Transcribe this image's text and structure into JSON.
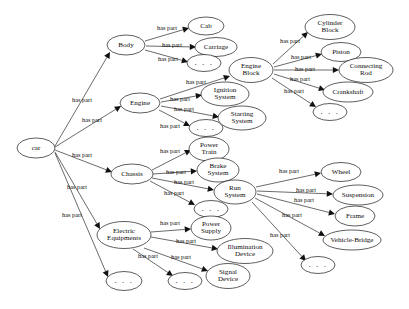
{
  "diagram": {
    "type": "directed-graph",
    "relation_label": "has part",
    "ellipsis_label": ". . .",
    "style": {
      "background": "#ffffff",
      "node_stroke": "#1a1a1a",
      "node_fill": "#ffffff",
      "edge_stroke": "#1a1a1a",
      "text_color": "#0d0d0d"
    },
    "nodes": [
      {
        "id": "car",
        "label": "car",
        "cx": 36,
        "cy": 148,
        "rx": 19,
        "ry": 10,
        "lines": [
          "car"
        ]
      },
      {
        "id": "body",
        "label": "Body",
        "cx": 126,
        "cy": 45,
        "rx": 19,
        "ry": 10,
        "lines": [
          "Body"
        ]
      },
      {
        "id": "engine",
        "label": "Engine",
        "cx": 140,
        "cy": 103,
        "rx": 20,
        "ry": 10,
        "lines": [
          "Engine"
        ]
      },
      {
        "id": "chassis",
        "label": "Chassis",
        "cx": 132,
        "cy": 174,
        "rx": 21,
        "ry": 10,
        "lines": [
          "Chassis"
        ]
      },
      {
        "id": "electric",
        "label": "Electric Equipments",
        "cx": 124,
        "cy": 235,
        "rx": 27,
        "ry": 13.5,
        "lines": [
          "Electric",
          "Equipments"
        ]
      },
      {
        "id": "car-dots",
        "label": ". . .",
        "cx": 124,
        "cy": 281,
        "rx": 18,
        "ry": 9.5,
        "lines": [
          ". . ."
        ],
        "is_dots": true
      },
      {
        "id": "cab",
        "label": "Cab",
        "cx": 206,
        "cy": 26,
        "rx": 18,
        "ry": 9,
        "lines": [
          "Cab"
        ]
      },
      {
        "id": "carriage",
        "label": "Carriage",
        "cx": 216,
        "cy": 47,
        "rx": 21,
        "ry": 9.5,
        "lines": [
          "Carriage"
        ]
      },
      {
        "id": "body-dots",
        "label": ". . .",
        "cx": 204,
        "cy": 63,
        "rx": 17,
        "ry": 8.5,
        "lines": [
          ". . ."
        ],
        "is_dots": true
      },
      {
        "id": "engine-block",
        "label": "Engine Block",
        "cx": 251,
        "cy": 70,
        "rx": 22,
        "ry": 12.5,
        "lines": [
          "Engine",
          "Block"
        ]
      },
      {
        "id": "ignition",
        "label": "Ignition System",
        "cx": 225,
        "cy": 94,
        "rx": 24,
        "ry": 12,
        "lines": [
          "Ignition",
          "System"
        ]
      },
      {
        "id": "starting",
        "label": "Starting System",
        "cx": 242,
        "cy": 118,
        "rx": 24,
        "ry": 12,
        "lines": [
          "Starting",
          "System"
        ]
      },
      {
        "id": "engine-dots",
        "label": ". . .",
        "cx": 206,
        "cy": 128,
        "rx": 17,
        "ry": 8.5,
        "lines": [
          ". . ."
        ],
        "is_dots": true
      },
      {
        "id": "cylinder",
        "label": "Cylinder Block",
        "cx": 330,
        "cy": 27,
        "rx": 25,
        "ry": 12.5,
        "lines": [
          "Cylinder",
          "Block"
        ]
      },
      {
        "id": "piston",
        "label": "Piston",
        "cx": 341,
        "cy": 52,
        "rx": 20,
        "ry": 9.5,
        "lines": [
          "Piston"
        ]
      },
      {
        "id": "connecting",
        "label": "Connecting Rod",
        "cx": 366,
        "cy": 70,
        "rx": 27,
        "ry": 12.5,
        "lines": [
          "Connecting",
          "Rod"
        ]
      },
      {
        "id": "crankshaft",
        "label": "Crankshaft",
        "cx": 348,
        "cy": 92,
        "rx": 25,
        "ry": 10,
        "lines": [
          "Crankshaft"
        ]
      },
      {
        "id": "eb-dots",
        "label": ". . .",
        "cx": 330,
        "cy": 112,
        "rx": 17,
        "ry": 8.5,
        "lines": [
          ". . ."
        ],
        "is_dots": true
      },
      {
        "id": "power-train",
        "label": "Power Train",
        "cx": 209,
        "cy": 149,
        "rx": 20,
        "ry": 12,
        "lines": [
          "Power",
          "Train"
        ]
      },
      {
        "id": "brake",
        "label": "Brake System",
        "cx": 218,
        "cy": 170,
        "rx": 21,
        "ry": 12,
        "lines": [
          "Brake",
          "System"
        ]
      },
      {
        "id": "run-system",
        "label": "Run System",
        "cx": 235,
        "cy": 192,
        "rx": 21,
        "ry": 12,
        "lines": [
          "Run",
          "System"
        ]
      },
      {
        "id": "chassis-dots",
        "label": ". . .",
        "cx": 211,
        "cy": 209,
        "rx": 17,
        "ry": 8.5,
        "lines": [
          ". . ."
        ],
        "is_dots": true
      },
      {
        "id": "power-supply",
        "label": "Power Supply",
        "cx": 211,
        "cy": 228,
        "rx": 20,
        "ry": 12,
        "lines": [
          "Power",
          "Supply"
        ]
      },
      {
        "id": "illumination",
        "label": "Illumination Device",
        "cx": 245,
        "cy": 251,
        "rx": 28,
        "ry": 12.5,
        "lines": [
          "Illumination",
          "Device"
        ]
      },
      {
        "id": "signal",
        "label": "Signal Device",
        "cx": 228,
        "cy": 276,
        "rx": 22,
        "ry": 12.5,
        "lines": [
          "Signal",
          "Device"
        ]
      },
      {
        "id": "elec-dots",
        "label": ". . .",
        "cx": 185,
        "cy": 281,
        "rx": 17,
        "ry": 8.5,
        "lines": [
          ". . ."
        ],
        "is_dots": true
      },
      {
        "id": "wheel",
        "label": "Wheel",
        "cx": 341,
        "cy": 172,
        "rx": 20,
        "ry": 9.5,
        "lines": [
          "Wheel"
        ]
      },
      {
        "id": "suspension",
        "label": "Suspension",
        "cx": 358,
        "cy": 195,
        "rx": 25,
        "ry": 10,
        "lines": [
          "Suspension"
        ]
      },
      {
        "id": "frame",
        "label": "Frame",
        "cx": 355,
        "cy": 216,
        "rx": 20,
        "ry": 10,
        "lines": [
          "Frame"
        ]
      },
      {
        "id": "vehicle-bridge",
        "label": "Vehicle-Bridge",
        "cx": 352,
        "cy": 240,
        "rx": 29,
        "ry": 10,
        "lines": [
          "Vehicle-Bridge"
        ]
      },
      {
        "id": "run-dots",
        "label": ". . .",
        "cx": 318,
        "cy": 265,
        "rx": 17,
        "ry": 8.5,
        "lines": [
          ". . ."
        ],
        "is_dots": true
      }
    ],
    "edges": [
      {
        "from": "car",
        "to": "body",
        "label": "has part",
        "x1": 55,
        "y1": 146,
        "x2": 110,
        "y2": 52,
        "lx": 82,
        "ly": 101
      },
      {
        "from": "car",
        "to": "engine",
        "label": "has part",
        "x1": 55,
        "y1": 147,
        "x2": 121,
        "y2": 106,
        "lx": 92,
        "ly": 121
      },
      {
        "from": "car",
        "to": "chassis",
        "label": "has part",
        "x1": 55,
        "y1": 150,
        "x2": 112,
        "y2": 172,
        "lx": 82,
        "ly": 156
      },
      {
        "from": "car",
        "to": "electric",
        "label": "has part",
        "x1": 55,
        "y1": 152,
        "x2": 100,
        "y2": 229,
        "lx": 77,
        "ly": 188
      },
      {
        "from": "car",
        "to": "car-dots",
        "label": "has part",
        "x1": 55,
        "y1": 153,
        "x2": 108,
        "y2": 277,
        "lx": 72,
        "ly": 216
      },
      {
        "from": "body",
        "to": "cab",
        "label": "has part",
        "x1": 145,
        "y1": 41,
        "x2": 189,
        "y2": 28,
        "lx": 167,
        "ly": 29
      },
      {
        "from": "body",
        "to": "carriage",
        "label": "has part",
        "x1": 146,
        "y1": 46,
        "x2": 196,
        "y2": 47,
        "lx": 172,
        "ly": 46
      },
      {
        "from": "body",
        "to": "body-dots",
        "label": "has part",
        "x1": 145,
        "y1": 50,
        "x2": 188,
        "y2": 62,
        "lx": 168,
        "ly": 60
      },
      {
        "from": "engine",
        "to": "engine-block",
        "label": "has part",
        "x1": 160,
        "y1": 99,
        "x2": 230,
        "y2": 76,
        "lx": 196,
        "ly": 83
      },
      {
        "from": "engine",
        "to": "ignition",
        "label": "has part",
        "x1": 161,
        "y1": 102,
        "x2": 202,
        "y2": 95,
        "lx": 180,
        "ly": 100
      },
      {
        "from": "engine",
        "to": "starting",
        "label": "has part",
        "x1": 161,
        "y1": 106,
        "x2": 219,
        "y2": 117,
        "lx": 184,
        "ly": 110
      },
      {
        "from": "engine",
        "to": "engine-dots",
        "label": "has part",
        "x1": 159,
        "y1": 110,
        "x2": 190,
        "y2": 126,
        "lx": 170,
        "ly": 127
      },
      {
        "from": "engine-block",
        "to": "cylinder",
        "label": "has part",
        "x1": 273,
        "y1": 64,
        "x2": 308,
        "y2": 32,
        "lx": 290,
        "ly": 42
      },
      {
        "from": "engine-block",
        "to": "piston",
        "label": "has part",
        "x1": 274,
        "y1": 67,
        "x2": 322,
        "y2": 54,
        "lx": 301,
        "ly": 58
      },
      {
        "from": "engine-block",
        "to": "connecting",
        "label": "has part",
        "x1": 274,
        "y1": 70,
        "x2": 339,
        "y2": 70,
        "lx": 305,
        "ly": 70
      },
      {
        "from": "engine-block",
        "to": "crankshaft",
        "label": "has part",
        "x1": 274,
        "y1": 74,
        "x2": 325,
        "y2": 90,
        "lx": 300,
        "ly": 80
      },
      {
        "from": "engine-block",
        "to": "eb-dots",
        "label": "has part",
        "x1": 272,
        "y1": 78,
        "x2": 316,
        "y2": 107,
        "lx": 294,
        "ly": 92
      },
      {
        "from": "chassis",
        "to": "power-train",
        "label": "has part",
        "x1": 152,
        "y1": 170,
        "x2": 191,
        "y2": 150,
        "lx": 170,
        "ly": 152
      },
      {
        "from": "chassis",
        "to": "brake",
        "label": "has part",
        "x1": 153,
        "y1": 174,
        "x2": 197,
        "y2": 171,
        "lx": 176,
        "ly": 173
      },
      {
        "from": "chassis",
        "to": "run-system",
        "label": "has part",
        "x1": 152,
        "y1": 178,
        "x2": 214,
        "y2": 190,
        "lx": 184,
        "ly": 183
      },
      {
        "from": "chassis",
        "to": "chassis-dots",
        "label": "has part",
        "x1": 150,
        "y1": 181,
        "x2": 195,
        "y2": 205,
        "lx": 174,
        "ly": 194
      },
      {
        "from": "run-system",
        "to": "wheel",
        "label": "has part",
        "x1": 256,
        "y1": 187,
        "x2": 321,
        "y2": 173,
        "lx": 289,
        "ly": 172
      },
      {
        "from": "run-system",
        "to": "suspension",
        "label": "has part",
        "x1": 257,
        "y1": 191,
        "x2": 333,
        "y2": 194,
        "lx": 306,
        "ly": 191
      },
      {
        "from": "run-system",
        "to": "frame",
        "label": "has part",
        "x1": 257,
        "y1": 194,
        "x2": 335,
        "y2": 214,
        "lx": 304,
        "ly": 201
      },
      {
        "from": "run-system",
        "to": "vehicle-bridge",
        "label": "has part",
        "x1": 255,
        "y1": 198,
        "x2": 325,
        "y2": 236,
        "lx": 292,
        "ly": 216
      },
      {
        "from": "run-system",
        "to": "run-dots",
        "label": "has part",
        "x1": 252,
        "y1": 202,
        "x2": 306,
        "y2": 261,
        "lx": 280,
        "ly": 236
      },
      {
        "from": "electric",
        "to": "power-supply",
        "label": "has part",
        "x1": 151,
        "y1": 232,
        "x2": 191,
        "y2": 229,
        "lx": 170,
        "ly": 224
      },
      {
        "from": "electric",
        "to": "illumination",
        "label": "has part",
        "x1": 151,
        "y1": 237,
        "x2": 218,
        "y2": 249,
        "lx": 186,
        "ly": 242
      },
      {
        "from": "electric",
        "to": "signal",
        "label": "has part",
        "x1": 144,
        "y1": 248,
        "x2": 208,
        "y2": 271,
        "lx": 181,
        "ly": 258
      },
      {
        "from": "electric",
        "to": "elec-dots",
        "label": "has part",
        "x1": 133,
        "y1": 249,
        "x2": 173,
        "y2": 276,
        "lx": 148,
        "ly": 257
      }
    ]
  }
}
